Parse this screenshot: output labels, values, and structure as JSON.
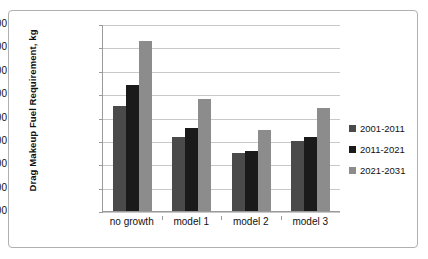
{
  "chart_data": {
    "type": "bar",
    "title": "",
    "xlabel": "",
    "ylabel": "Drag Makeup Fuel Requirement, kg",
    "categories": [
      "no growth",
      "model 1",
      "model 2",
      "model 3"
    ],
    "series": [
      {
        "name": "2001-2011",
        "color": "#4a4a4a",
        "values": [
          65000,
          62300,
          61000,
          62000
        ]
      },
      {
        "name": "2011-2021",
        "color": "#1a1a1a",
        "values": [
          66800,
          63100,
          61150,
          62300
        ]
      },
      {
        "name": "2021-2031",
        "color": "#8c8c8c",
        "values": [
          70550,
          65600,
          62900,
          64850
        ]
      }
    ],
    "ylim": [
      56000,
      72000
    ],
    "yticks": [
      72000,
      70000,
      68000,
      66000,
      64000,
      62000,
      60000,
      58000,
      56000
    ],
    "grid": true,
    "legend_position": "right"
  }
}
